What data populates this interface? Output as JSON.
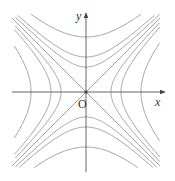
{
  "diagram": {
    "axes": {
      "x_label": "x",
      "y_label": "y",
      "origin_label": "O",
      "origin_px": [
        86,
        92
      ],
      "x_range_px": [
        12,
        166
      ],
      "y_range_px": [
        12,
        172
      ]
    },
    "colors": {
      "curve": "#8a8a8a",
      "axis": "#555555",
      "background": "#ffffff"
    },
    "asymptotes": [
      "y = x",
      "y = -x"
    ],
    "horizontal_opening_vertices_px": [
      25,
      35,
      55
    ],
    "vertical_opening_vertices_px": [
      25,
      35,
      55
    ]
  }
}
